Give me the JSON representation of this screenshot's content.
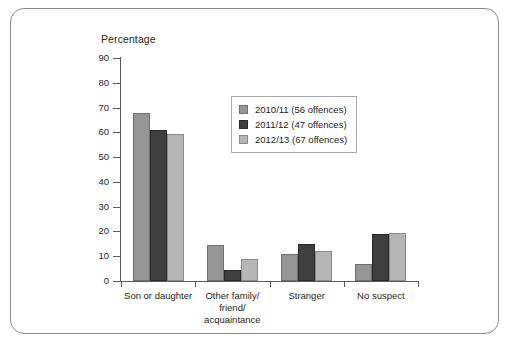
{
  "frame": {
    "border_color": "#8a8a8d"
  },
  "chart_data": {
    "type": "bar",
    "title": "",
    "ylabel": "Percentage",
    "xlabel": "",
    "ylim": [
      0,
      90
    ],
    "ytick_step": 10,
    "yticks": [
      "90",
      "80",
      "70",
      "60",
      "50",
      "40",
      "30",
      "20",
      "10",
      "0"
    ],
    "grid": false,
    "legend_position": "upper-center",
    "categories": [
      "Son or daughter",
      "Other family/\nfriend/\nacquaintance",
      "Stranger",
      "No suspect"
    ],
    "category_lines": [
      [
        "Son or daughter"
      ],
      [
        "Other family/",
        "friend/",
        "acquaintance"
      ],
      [
        "Stranger"
      ],
      [
        "No suspect"
      ]
    ],
    "series": [
      {
        "name": "2010/11 (56 offences)",
        "color": "#969696",
        "values": [
          68,
          14.5,
          11,
          7
        ]
      },
      {
        "name": "2011/12 (47 offences)",
        "color": "#3f3f3f",
        "values": [
          61,
          4.5,
          15,
          19
        ]
      },
      {
        "name": "2012/13 (67 offences)",
        "color": "#b6b6b6",
        "values": [
          59.5,
          9,
          12,
          19.5
        ]
      }
    ]
  }
}
